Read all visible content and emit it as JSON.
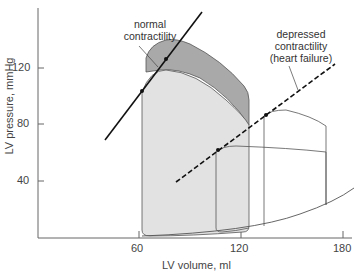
{
  "axes": {
    "x_label": "LV volume, ml",
    "y_label": "LV pressure, mmHg",
    "x_ticks": [
      "60",
      "120",
      "180"
    ],
    "y_ticks": [
      "120",
      "80",
      "40"
    ]
  },
  "annotations": {
    "normal_line1": "normal",
    "normal_line2": "contractility",
    "depressed_line1": "depressed",
    "depressed_line2": "contractility",
    "depressed_line3": "(heart failure)"
  },
  "colors": {
    "light_loop": "#e2e2e2",
    "dark_region": "#a9a9a9",
    "line": "#111111",
    "thin_line": "#555555"
  }
}
